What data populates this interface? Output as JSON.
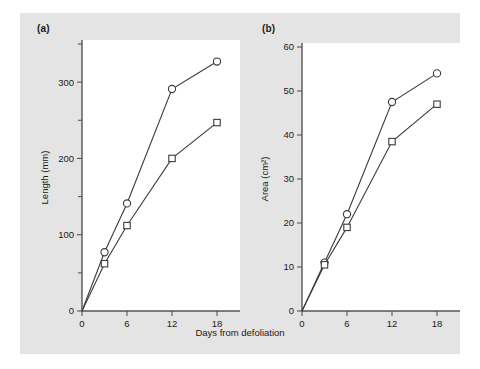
{
  "figure": {
    "background_color": "#e4e4e4",
    "page_color": "#ffffff",
    "plot_area_color": "#ffffff",
    "axis_color": "#555555",
    "line_color": "#3a3a3a",
    "shared_xlabel": "Days from defoliation",
    "panel_a_label": "(a)",
    "panel_b_label": "(b)"
  },
  "chart_data": [
    {
      "type": "line",
      "panel": "(a)",
      "title": "",
      "xlabel": "Days from defoliation",
      "ylabel": "Length (mm)",
      "x": [
        0,
        3,
        6,
        12,
        18
      ],
      "xlim": [
        0,
        20
      ],
      "ylim": [
        0,
        350
      ],
      "xticks": [
        0,
        6,
        12,
        18
      ],
      "xticklabels": [
        "0",
        "6",
        "12",
        "18"
      ],
      "yticks": [
        0,
        100,
        200,
        300
      ],
      "yticklabels": [
        "0",
        "100",
        "200",
        "300"
      ],
      "yminorticks": [
        50,
        150,
        250,
        350
      ],
      "grid": false,
      "legend": "none",
      "series": [
        {
          "name": "circles",
          "marker": "open-circle",
          "values": [
            0,
            77,
            141,
            291,
            327
          ]
        },
        {
          "name": "squares",
          "marker": "open-square",
          "values": [
            0,
            62,
            112,
            200,
            247
          ]
        }
      ]
    },
    {
      "type": "line",
      "panel": "(b)",
      "title": "",
      "xlabel": "Days from defoliation",
      "ylabel": "Area (cm²)",
      "x": [
        0,
        3,
        6,
        12,
        18
      ],
      "xlim": [
        0,
        20
      ],
      "ylim": [
        0,
        60
      ],
      "xticks": [
        0,
        6,
        12,
        18
      ],
      "xticklabels": [
        "0",
        "6",
        "12",
        "18"
      ],
      "yticks": [
        0,
        10,
        20,
        30,
        40,
        50,
        60
      ],
      "yticklabels": [
        "0",
        "10",
        "20",
        "30",
        "40",
        "50",
        "60"
      ],
      "yminorticks": [],
      "grid": false,
      "legend": "none",
      "series": [
        {
          "name": "circles",
          "marker": "open-circle",
          "values": [
            0,
            11,
            22,
            47.5,
            54
          ]
        },
        {
          "name": "squares",
          "marker": "open-square",
          "values": [
            0,
            10.5,
            19,
            38.5,
            47
          ]
        }
      ]
    }
  ]
}
